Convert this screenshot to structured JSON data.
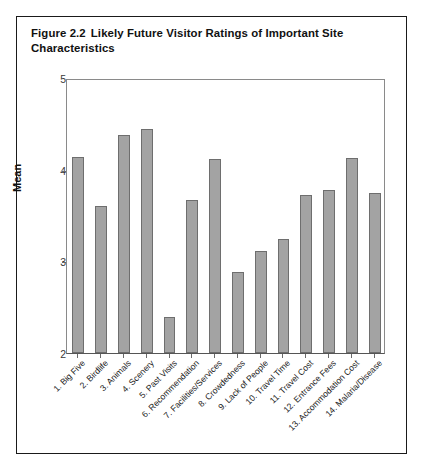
{
  "figure": {
    "number": "Figure 2.2",
    "caption": "Likely Future Visitor Ratings of Important Site Characteristics"
  },
  "chart_data": {
    "type": "bar",
    "title": "Likely Future Visitor Ratings of Important Site Characteristics",
    "xlabel": "",
    "ylabel": "Mean",
    "ylim": [
      2,
      5
    ],
    "yticks": [
      "2",
      "3",
      "4",
      "5"
    ],
    "grid": false,
    "legend": "none",
    "bar_color": "#a3a3a3",
    "bar_edge_color": "#6e6e6e",
    "categories": [
      "1. Big Five",
      "2. Birdlife",
      "3. Animals",
      "4. Scenery",
      "5. Past Visits",
      "6. Recommendation",
      "7. Facilities/Services",
      "8. Crowdedness",
      "9. Lack of People",
      "10. Travel Time",
      "11. Travel Cost",
      "12. Entrance Fees",
      "13. Accommodation Cost",
      "14. Malaria/Disease"
    ],
    "values": [
      4.14,
      3.6,
      4.38,
      4.44,
      2.39,
      3.67,
      4.12,
      2.88,
      3.11,
      3.24,
      3.72,
      3.78,
      4.13,
      3.75
    ]
  }
}
